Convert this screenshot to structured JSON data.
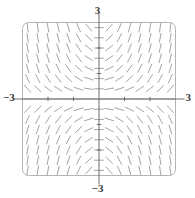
{
  "figure": {
    "kind": "slope-field",
    "caption_top": "3",
    "caption_bottom": "−3",
    "caption_left": "−3",
    "caption_right": "3"
  },
  "chart_data": {
    "type": "scatter",
    "subtype": "slope-field",
    "title": "",
    "subtitle": "",
    "xlabel": "",
    "ylabel": "",
    "xlim": [
      -3,
      3
    ],
    "ylim": [
      -3,
      3
    ],
    "grid": false,
    "legend": null,
    "legend_position": "none",
    "axes": {
      "x_axis_drawn": true,
      "y_axis_drawn": true,
      "x_axis_y_value": 0,
      "y_axis_x_value": 0,
      "tick_marks": true,
      "tick_values_x": [
        -2,
        -1,
        1,
        2
      ],
      "tick_values_y": [
        -2,
        -1,
        1,
        2
      ],
      "tick_labels_shown": false
    },
    "frame": {
      "shape": "rounded-rectangle",
      "corner_radius_px": 6,
      "stroke": "#b4b4b4"
    },
    "tick_labels": {
      "top": "3",
      "bottom": "−3",
      "left": "−3",
      "right": "3"
    },
    "annotations": [],
    "field": {
      "slope_formula": "dy/dx = x*y",
      "description": "Short line segments of equal length drawn on a uniform grid; segments are near-vertical far from the axes and flatten to horizontal along x=0 and y=0, producing a saddle pattern.",
      "grid_nx": 15,
      "grid_ny": 15,
      "x_samples": [
        -2.8,
        -2.4,
        -2.0,
        -1.6,
        -1.2,
        -0.8,
        -0.4,
        0.0,
        0.4,
        0.8,
        1.2,
        1.6,
        2.0,
        2.4,
        2.8
      ],
      "y_samples": [
        2.8,
        2.4,
        2.0,
        1.6,
        1.2,
        0.8,
        0.4,
        0.0,
        -0.4,
        -0.8,
        -1.2,
        -1.6,
        -2.0,
        -2.4,
        -2.8
      ],
      "segment_length_px": 9,
      "stroke": "#9a9a9a",
      "stroke_width": 0.9
    },
    "style": {
      "background": "#ffffff",
      "segment_color": "#9a9a9a",
      "axis_color": "#6e6e6e",
      "frame_color": "#b4b4b4",
      "label_color": "#3a3a3a"
    }
  }
}
